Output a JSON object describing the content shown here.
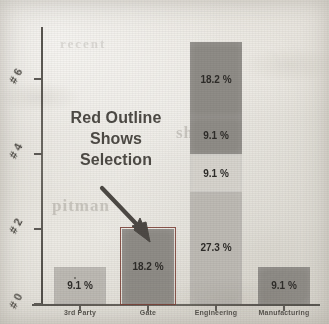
{
  "chart_data": {
    "type": "bar",
    "subtype": "stacked-bar",
    "title": "",
    "xlabel": "",
    "ylabel": "#",
    "categories": [
      "3rd Party",
      "Gate",
      "Engineering",
      "Manufacturing"
    ],
    "ylim": [
      0,
      7
    ],
    "y_ticks": [
      0,
      2,
      4,
      6
    ],
    "y_tick_labels": [
      "# 0",
      "# 2",
      "# 4",
      "# 6"
    ],
    "grid": false,
    "legend": "none",
    "value_format": "percent",
    "series": [
      {
        "name": "segment-1",
        "values": [
          1,
          2,
          3,
          1
        ],
        "labels": [
          "9.1 %",
          "18.2 %",
          "27.3 %",
          "9.1 %"
        ]
      },
      {
        "name": "segment-2",
        "values": [
          0,
          0,
          1,
          0
        ],
        "labels": [
          "",
          "",
          "9.1 %",
          ""
        ]
      },
      {
        "name": "segment-3",
        "values": [
          0,
          0,
          1,
          0
        ],
        "labels": [
          "",
          "",
          "9.1 %",
          ""
        ]
      },
      {
        "name": "segment-4",
        "values": [
          0,
          0,
          2,
          0
        ],
        "labels": [
          "",
          "",
          "18.2 %",
          ""
        ]
      }
    ],
    "bars": [
      {
        "category": "3rd Party",
        "total_label": "9.1 %",
        "selected": false,
        "segments": [
          {
            "label": "9.1 %",
            "percent": 9.1,
            "count": 1,
            "shade": "light"
          }
        ]
      },
      {
        "category": "Gate",
        "total_label": "18.2 %",
        "selected": true,
        "segments": [
          {
            "label": "18.2 %",
            "percent": 18.2,
            "count": 2,
            "shade": "dark"
          }
        ]
      },
      {
        "category": "Engineering",
        "total_label": "63.7 %",
        "selected": false,
        "segments": [
          {
            "label": "27.3 %",
            "percent": 27.3,
            "count": 3,
            "shade": "light"
          },
          {
            "label": "9.1 %",
            "percent": 9.1,
            "count": 1,
            "shade": "pale"
          },
          {
            "label": "9.1 %",
            "percent": 9.1,
            "count": 1,
            "shade": "dark"
          },
          {
            "label": "18.2 %",
            "percent": 18.2,
            "count": 2,
            "shade": "dark"
          }
        ]
      },
      {
        "category": "Manufacturing",
        "total_label": "9.1 %",
        "selected": false,
        "segments": [
          {
            "label": "9.1 %",
            "percent": 9.1,
            "count": 1,
            "shade": "dark"
          }
        ]
      }
    ]
  },
  "annotation": {
    "line_1": "Red Outline",
    "line_2": "Shows",
    "line_3": "Selection",
    "target": "Gate",
    "arrow": "arrow-down-right"
  },
  "ghost_text": {
    "right": "shaker",
    "left": "pitman",
    "top": "recent"
  },
  "colors": {
    "selection_outline": "#7a3d33",
    "bar_dark": "#8f8c87",
    "bar_light": "#bdbab4",
    "bar_pale": "#d6d3cd",
    "axis": "#55524d",
    "text": "#4a4742",
    "paper": "#e9e7e1"
  }
}
